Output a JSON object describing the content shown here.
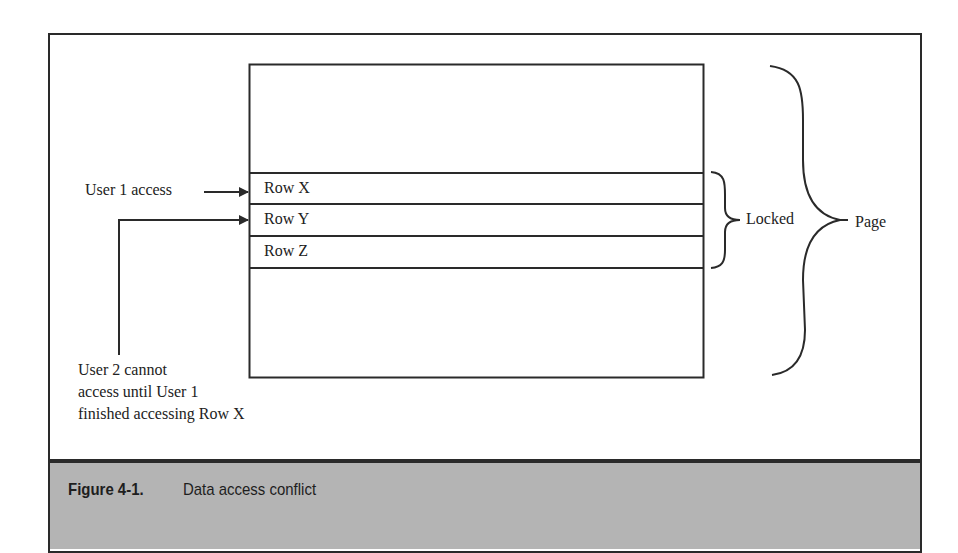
{
  "figure": {
    "number": "Figure 4-1.",
    "title": "Data access conflict"
  },
  "diagram": {
    "rows": [
      {
        "label": "Row X"
      },
      {
        "label": "Row Y"
      },
      {
        "label": "Row Z"
      }
    ],
    "user1_label": "User 1 access",
    "user2_label_lines": [
      "User 2 cannot",
      "access until User 1",
      "finished accessing Row X"
    ],
    "locked_label": "Locked",
    "page_label": "Page"
  },
  "colors": {
    "line": "#2a2a2a",
    "caption_background": "#b4b4b4",
    "background": "#ffffff"
  }
}
